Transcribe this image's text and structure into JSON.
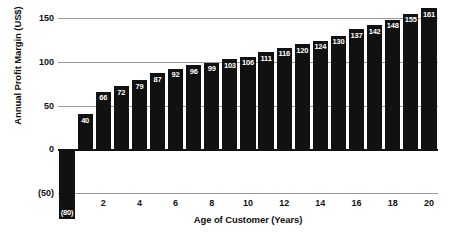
{
  "chart_data": {
    "type": "bar",
    "title": "",
    "xlabel": "Age of Customer (Years)",
    "ylabel": "Annual Profit Margin (US$)",
    "categories": [
      "0",
      "1",
      "2",
      "3",
      "4",
      "5",
      "6",
      "7",
      "8",
      "9",
      "10",
      "11",
      "12",
      "13",
      "14",
      "15",
      "16",
      "17",
      "18",
      "19",
      "20"
    ],
    "values": [
      -80,
      40,
      66,
      72,
      79,
      87,
      92,
      96,
      99,
      103,
      106,
      111,
      116,
      120,
      124,
      130,
      137,
      142,
      148,
      155,
      161
    ],
    "value_labels": [
      "(80)",
      "40",
      "66",
      "72",
      "79",
      "87",
      "92",
      "96",
      "99",
      "103",
      "106",
      "111",
      "116",
      "120",
      "124",
      "130",
      "137",
      "142",
      "148",
      "155",
      "161"
    ],
    "ylim": [
      -50,
      150
    ],
    "y_ticks": [
      150,
      100,
      50,
      0,
      -50
    ],
    "y_tick_labels": [
      "150",
      "100",
      "50",
      "0",
      "(50)"
    ],
    "x_ticks": [
      0,
      2,
      4,
      6,
      8,
      10,
      12,
      14,
      16,
      18,
      20
    ],
    "x_tick_labels": [
      "0",
      "2",
      "4",
      "6",
      "8",
      "10",
      "12",
      "14",
      "16",
      "18",
      "20"
    ],
    "grid": true,
    "legend": false,
    "bar_color": "#111111",
    "gridline_color": "#9a9a9a",
    "axis_color": "#111111",
    "value_label_color": "#ffffff"
  }
}
